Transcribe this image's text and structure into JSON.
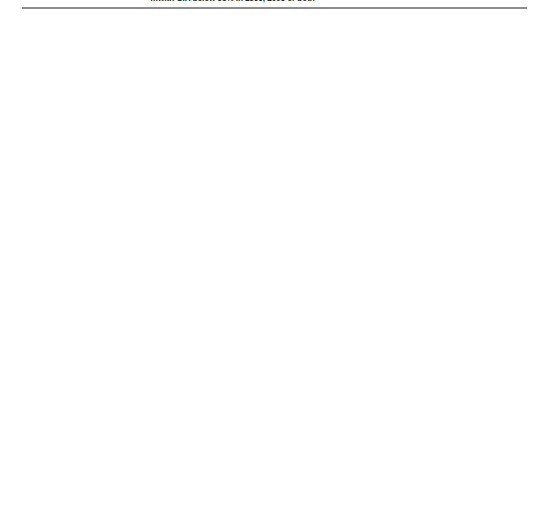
{
  "title": "…with GIR below 95% in 1999, 2005 or both",
  "axis": {
    "xlabel": "Gross intake rates (%)",
    "ticks": [
      20,
      40,
      60,
      80,
      100,
      120,
      140
    ],
    "xmin": 20,
    "xmax": 140
  },
  "legend": [
    {
      "marker": "bar-1999-icon",
      "label": "1999"
    },
    {
      "marker": "arrow-right-icon",
      "label": "2005 (increase since 1999)"
    },
    {
      "marker": "arrow-left-icon",
      "label": "2005 (decrease since 1999)"
    },
    {
      "marker": "stable-icon",
      "label": "Stable"
    }
  ],
  "chart_data": {
    "type": "bar",
    "title": "…with GIR below 95% in 1999, 2005 or both",
    "xlabel": "Gross intake rates (%)",
    "ylabel": "",
    "xlim": [
      20,
      140
    ],
    "grid": true,
    "legend_position": "bottom",
    "series": [
      {
        "name": "1999",
        "marker": "tick"
      },
      {
        "name": "2005 (increase since 1999)",
        "marker": "arrow-right"
      },
      {
        "name": "2005 (decrease since 1999)",
        "marker": "arrow-left"
      },
      {
        "name": "Stable",
        "marker": "stable"
      }
    ],
    "panels": [
      {
        "panel": "left",
        "groups": [
          {
            "group": "Sub-Saharan Africa",
            "rows": [
              {
                "label": "Eritrea",
                "v1999": 55.0,
                "v2005": 45.0,
                "state": "decrease"
              },
              {
                "label": "Niger",
                "v1999": 37.0,
                "v2005": 56.0,
                "state": "increase"
              },
              {
                "label": "C. A. R.",
                "v1999": 56.0,
                "v2005": 56.0,
                "state": "stable"
              },
              {
                "label": "Congo",
                "v1999": 26.0,
                "v2005": 58.0,
                "state": "increase"
              },
              {
                "label": "Mali",
                "v1999": 48.0,
                "v2005": 59.0,
                "state": "increase"
              },
              {
                "label": "D. R. Congo",
                "v1999": 48.0,
                "v2005": 61.0,
                "state": "increase"
              },
              {
                "label": "Comoros",
                "v1999": 62.0,
                "v2005": 62.0,
                "state": "stable"
              },
              {
                "label": "Côte d'Ivoire",
                "v1999": 60.0,
                "v2005": 63.0,
                "state": "increase"
              },
              {
                "label": "Burkina Faso",
                "v1999": 44.0,
                "v2005": 66.0,
                "state": "increase"
              },
              {
                "label": "Guinea",
                "v1999": 48.0,
                "v2005": 72.0,
                "state": "increase"
              },
              {
                "label": "Burundi",
                "v1999": 62.0,
                "v2005": 75.0,
                "state": "increase"
              },
              {
                "label": "Gambia",
                "v1999": 70.0,
                "v2005": 76.0,
                "state": "increase"
              },
              {
                "label": "Senegal",
                "v1999": 53.0,
                "v2005": 77.0,
                "state": "increase"
              },
              {
                "label": "Togo",
                "v1999": 78.0,
                "v2005": 78.0,
                "state": "stable"
              },
              {
                "label": "Cape Verde",
                "v1999": 82.0,
                "v2005": 78.0,
                "state": "decrease"
              },
              {
                "label": "Gabon",
                "v1999": 79.0,
                "v2005": 79.0,
                "state": "stable"
              },
              {
                "label": "Chad",
                "v1999": 57.0,
                "v2005": 80.0,
                "state": "increase"
              },
              {
                "label": "Namibia",
                "v1999": 75.0,
                "v2005": 81.0,
                "state": "increase"
              },
              {
                "label": "U. R. Tanzania",
                "v1999": 57.0,
                "v2005": 87.0,
                "state": "increase"
              },
              {
                "label": "Ghana",
                "v1999": 67.0,
                "v2005": 88.0,
                "state": "increase"
              },
              {
                "label": "Cameroon",
                "v1999": 63.0,
                "v2005": 89.0,
                "state": "increase"
              },
              {
                "label": "Ethiopia",
                "v1999": 62.0,
                "v2005": 96.0,
                "state": "increase"
              },
              {
                "label": "Zambia",
                "v1999": 62.0,
                "v2005": 98.0,
                "state": "increase"
              }
            ]
          },
          {
            "group": "Arab States",
            "rows": [
              {
                "label": "Djibouti",
                "v1999": 30.0,
                "v2005": 42.0,
                "state": "increase"
              },
              {
                "label": "Sudan",
                "v1999": 67.0,
                "v2005": 67.0,
                "state": "stable"
              },
              {
                "label": "Oman",
                "v1999": 86.0,
                "v2005": 75.0,
                "state": "decrease"
              },
              {
                "label": "Palestinian A. T.",
                "v1999": 105.0,
                "v2005": 81.0,
                "state": "decrease"
              },
              {
                "label": "Jordan",
                "v1999": 101.0,
                "v2005": 84.0,
                "state": "decrease"
              },
              {
                "label": "Saudi Arabia",
                "v1999": 87.0,
                "v2005": 87.0,
                "state": "stable"
              },
              {
                "label": "U. A. Emirates",
                "v1999": 88.0,
                "v2005": 88.0,
                "state": "stable"
              },
              {
                "label": "Kuwait",
                "v1999": 96.0,
                "v2005": 93.0,
                "state": "decrease"
              },
              {
                "label": "Egypt",
                "v1999": 92.0,
                "v2005": 102.0,
                "state": "increase"
              },
              {
                "label": "Yemen",
                "v1999": 78.0,
                "v2005": 109.0,
                "state": "increase"
              }
            ]
          }
        ]
      },
      {
        "panel": "right",
        "groups": [
          {
            "group": "Central Asia",
            "rows": [
              {
                "label": "Azerbaijan",
                "v1999": 95.0,
                "v2005": 93.0,
                "state": "decrease"
              }
            ]
          },
          {
            "group": "East Asia and the Pacific",
            "rows": [
              {
                "label": "Niue",
                "v1999": 103.0,
                "v2005": 78.0,
                "state": "decrease"
              },
              {
                "label": "Tokelau",
                "v1999": 84.0,
                "v2005": 84.0,
                "state": "stable"
              },
              {
                "label": "Cook Islands",
                "v1999": 121.0,
                "v2005": 86.0,
                "state": "decrease"
              },
              {
                "label": "China",
                "v1999": 92.0,
                "v2005": 92.0,
                "state": "stable"
              },
              {
                "label": "Viet Nam",
                "v1999": 105.0,
                "v2005": 91.0,
                "state": "decrease"
              },
              {
                "label": "Palau",
                "v1999": 113.0,
                "v2005": 93.0,
                "state": "decrease"
              },
              {
                "label": "Tuvalu",
                "v1999": 92.0,
                "v2005": 94.0,
                "state": "increase"
              },
              {
                "label": "Macao, China",
                "v1999": 92.0,
                "v2005": 95.0,
                "state": "increase"
              }
            ]
          },
          {
            "group": "South and West Asia",
            "rows": [
              {
                "label": "Maldives",
                "v1999": 101.0,
                "v2005": 77.0,
                "state": "decrease"
              },
              {
                "label": "Afghanistan",
                "v1999": 87.0,
                "v2005": 87.0,
                "state": "stable"
              },
              {
                "label": "Sri Lanka",
                "v1999": 93.0,
                "v2005": 93.0,
                "state": "stable"
              },
              {
                "label": "Iran, Isl. Rep.¹",
                "v1999": 91.0,
                "v2005": 114.0,
                "state": "increase"
              }
            ]
          },
          {
            "group": "Latin America and the Caribbean",
            "rows": [
              {
                "label": "Turks/Caicos Is",
                "v1999": 87.0,
                "v2005": 87.0,
                "state": "stable"
              },
              {
                "label": "Cayman Is",
                "v1999": 90.0,
                "v2005": 90.0,
                "state": "stable"
              },
              {
                "label": "Dominica",
                "v1999": 111.0,
                "v2005": 89.0,
                "state": "decrease"
              },
              {
                "label": "Jamaica",
                "v1999": 92.0,
                "v2005": 92.0,
                "state": "stable"
              },
              {
                "label": "St Kitts/Nevis",
                "v1999": 92.0,
                "v2005": 92.0,
                "state": "stable"
              },
              {
                "label": "Chile",
                "v1999": 94.0,
                "v2005": 97.0,
                "state": "increase"
              }
            ]
          },
          {
            "group": "North America and Western Europe",
            "rows": [
              {
                "label": "Switzerland",
                "v1999": 96.0,
                "v2005": 93.0,
                "state": "decrease"
              },
              {
                "label": "Malta",
                "v1999": 101.0,
                "v2005": 93.0,
                "state": "decrease"
              },
              {
                "label": "Sweden",
                "v1999": 104.0,
                "v2005": 93.0,
                "state": "decrease"
              }
            ]
          },
          {
            "group": "Central and Eastern Europe",
            "rows": [
              {
                "label": "Rep. Moldova",
                "v1999": 99.0,
                "v2005": 92.0,
                "state": "decrease"
              },
              {
                "label": "Turkey",
                "v1999": 93.0,
                "v2005": 93.0,
                "state": "stable"
              },
              {
                "label": "Latvia",
                "v1999": 96.0,
                "v2005": 93.0,
                "state": "decrease"
              },
              {
                "label": "Russian Fed.",
                "v1999": 86.0,
                "v2005": 95.0,
                "state": "increase"
              },
              {
                "label": "Croatia",
                "v1999": 93.0,
                "v2005": 96.0,
                "state": "increase"
              },
              {
                "label": "Romania",
                "v1999": 93.0,
                "v2005": 96.0,
                "state": "increase"
              },
              {
                "label": "Ukraine",
                "v1999": 92.0,
                "v2005": 100.0,
                "state": "increase"
              }
            ]
          }
        ]
      }
    ]
  }
}
